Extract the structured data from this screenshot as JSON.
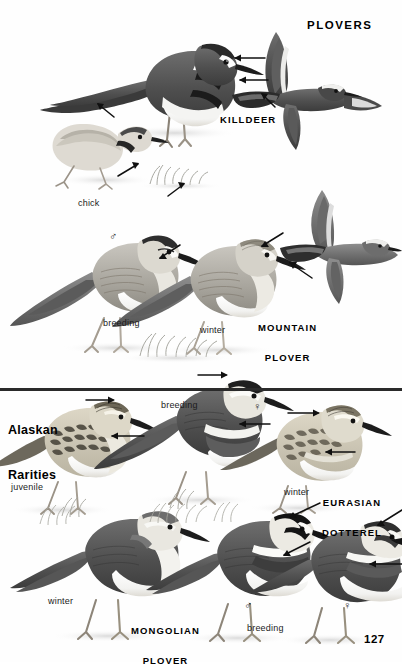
{
  "page": {
    "number": "127",
    "plate_title": "PLOVERS",
    "background_color": "#ffffff",
    "ink_color": "#111111"
  },
  "divider": {
    "color": "#2a2a2a",
    "y": 388,
    "thickness": 3
  },
  "sections": [
    {
      "id": "killdeer",
      "species_label": "KILLDEER",
      "captions": [
        {
          "text": "chick",
          "x": 78,
          "y": 199
        }
      ]
    },
    {
      "id": "mountain-plover",
      "species_label": "MOUNTAIN PLOVER",
      "species_label_lines": [
        "MOUNTAIN",
        "PLOVER"
      ],
      "captions": [
        {
          "text": "breeding",
          "x": 103,
          "y": 319
        },
        {
          "text": "winter",
          "x": 200,
          "y": 326
        }
      ],
      "symbols": [
        {
          "glyph": "♂",
          "x": 111,
          "y": 232
        }
      ]
    },
    {
      "id": "alaskan-rarities",
      "group_label_lines": [
        "Alaskan",
        "Rarities"
      ],
      "species_label": "EURASIAN DOTTEREL",
      "species_label_lines": [
        "EURASIAN",
        "DOTTEREL"
      ],
      "captions": [
        {
          "text": "breeding",
          "x": 161,
          "y": 401
        },
        {
          "text": "juvenile",
          "x": 11,
          "y": 483
        },
        {
          "text": "winter",
          "x": 284,
          "y": 488
        }
      ],
      "symbols": [
        {
          "glyph": "♀",
          "x": 255,
          "y": 404
        }
      ]
    },
    {
      "id": "mongolian-plover",
      "species_label": "MONGOLIAN PLOVER",
      "species_label_lines": [
        "MONGOLIAN",
        "PLOVER"
      ],
      "captions": [
        {
          "text": "winter",
          "x": 48,
          "y": 598
        },
        {
          "text": "breeding",
          "x": 247,
          "y": 625
        }
      ],
      "symbols": [
        {
          "glyph": "♂",
          "x": 246,
          "y": 601
        },
        {
          "glyph": "♀",
          "x": 345,
          "y": 601
        }
      ]
    }
  ],
  "labels": {
    "plovers": "PLOVERS",
    "killdeer": "KILLDEER",
    "mountain_line1": "MOUNTAIN",
    "mountain_line2": "PLOVER",
    "alaskan_line1": "Alaskan",
    "alaskan_line2": "Rarities",
    "eurasian_line1": "EURASIAN",
    "eurasian_line2": "DOTTEREL",
    "mongolian_line1": "MONGOLIAN",
    "mongolian_line2": "PLOVER",
    "chick": "chick",
    "breeding_mountain": "breeding",
    "winter_mountain": "winter",
    "breeding_dotterel": "breeding",
    "juvenile": "juvenile",
    "winter_dotterel": "winter",
    "winter_mongolian": "winter",
    "breeding_mongolian": "breeding",
    "male_mountain": "♂",
    "female_dotterel": "♀",
    "male_mongolian": "♂",
    "female_mongolian": "♀",
    "page_number": "127"
  }
}
